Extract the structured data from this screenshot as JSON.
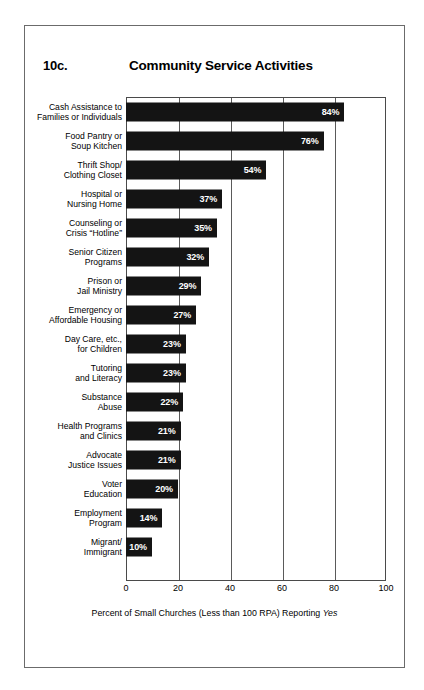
{
  "figure": {
    "number": "10c.",
    "title": "Community Service Activities"
  },
  "chart_data": {
    "type": "bar",
    "orientation": "horizontal",
    "title": "Community Service Activities",
    "figure_number": "10c.",
    "xlabel": "Percent of Small Churches (Less than 100 RPA) Reporting Yes",
    "xlabel_italic_word": "Yes",
    "ylabel": "",
    "xlim": [
      0,
      100
    ],
    "xticks": [
      0,
      20,
      40,
      60,
      80,
      100
    ],
    "xtick_labels": [
      "0",
      "20",
      "40",
      "60",
      "80",
      "100"
    ],
    "grid": true,
    "grid_axis": "x",
    "legend": false,
    "bar_color": "#141414",
    "value_label_color": "#ffffff",
    "value_label_suffix": "%",
    "categories": [
      "Cash Assistance to\nFamilies or Individuals",
      "Food Pantry or\nSoup Kitchen",
      "Thrift Shop/\nClothing Closet",
      "Hospital or\nNursing Home",
      "Counseling or\nCrisis “Hotline”",
      "Senior Citizen\nPrograms",
      "Prison or\nJail Ministry",
      "Emergency or\nAffordable Housing",
      "Day Care, etc.,\nfor Children",
      "Tutoring\nand Literacy",
      "Substance\nAbuse",
      "Health Programs\nand Clinics",
      "Advocate\nJustice Issues",
      "Voter\nEducation",
      "Employment\nProgram",
      "Migrant/\nImmigrant"
    ],
    "values": [
      84,
      76,
      54,
      37,
      35,
      32,
      29,
      27,
      23,
      23,
      22,
      21,
      21,
      20,
      14,
      10
    ],
    "value_labels": [
      "84%",
      "76%",
      "54%",
      "37%",
      "35%",
      "32%",
      "29%",
      "27%",
      "23%",
      "23%",
      "22%",
      "21%",
      "21%",
      "20%",
      "14%",
      "10%"
    ]
  },
  "rows": [
    {
      "line1": "Cash Assistance to",
      "line2": "Families or Individuals",
      "value": 84,
      "label": "84%"
    },
    {
      "line1": "Food Pantry or",
      "line2": "Soup Kitchen",
      "value": 76,
      "label": "76%"
    },
    {
      "line1": "Thrift Shop/",
      "line2": "Clothing Closet",
      "value": 54,
      "label": "54%"
    },
    {
      "line1": "Hospital or",
      "line2": "Nursing Home",
      "value": 37,
      "label": "37%"
    },
    {
      "line1": "Counseling or",
      "line2": "Crisis “Hotline”",
      "value": 35,
      "label": "35%"
    },
    {
      "line1": "Senior Citizen",
      "line2": "Programs",
      "value": 32,
      "label": "32%"
    },
    {
      "line1": "Prison or",
      "line2": "Jail Ministry",
      "value": 29,
      "label": "29%"
    },
    {
      "line1": "Emergency or",
      "line2": "Affordable Housing",
      "value": 27,
      "label": "27%"
    },
    {
      "line1": "Day Care, etc.,",
      "line2": "for Children",
      "value": 23,
      "label": "23%"
    },
    {
      "line1": "Tutoring",
      "line2": "and Literacy",
      "value": 23,
      "label": "23%"
    },
    {
      "line1": "Substance",
      "line2": "Abuse",
      "value": 22,
      "label": "22%"
    },
    {
      "line1": "Health Programs",
      "line2": "and Clinics",
      "value": 21,
      "label": "21%"
    },
    {
      "line1": "Advocate",
      "line2": "Justice Issues",
      "value": 21,
      "label": "21%"
    },
    {
      "line1": "Voter",
      "line2": "Education",
      "value": 20,
      "label": "20%"
    },
    {
      "line1": "Employment",
      "line2": "Program",
      "value": 14,
      "label": "14%"
    },
    {
      "line1": "Migrant/",
      "line2": "Immigrant",
      "value": 10,
      "label": "10%"
    }
  ],
  "axis": {
    "ticks": [
      "0",
      "20",
      "40",
      "60",
      "80",
      "100"
    ],
    "caption_before": "Percent of Small Churches (Less than 100 RPA) Reporting ",
    "caption_italic": "Yes"
  }
}
